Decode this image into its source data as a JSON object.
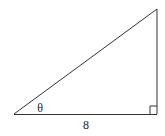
{
  "diagram": {
    "type": "right-triangle",
    "vertices": {
      "left": [
        14,
        114
      ],
      "right_angle": [
        157,
        114
      ],
      "top": [
        157,
        9
      ]
    },
    "right_angle_marker_size": 8,
    "angle_label": "θ",
    "base_label": "8",
    "stroke_color": "#333333"
  }
}
